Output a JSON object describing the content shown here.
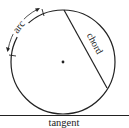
{
  "diagram": {
    "labels": {
      "arc": "arc",
      "chord": "chord",
      "tangent": "tangent"
    },
    "circle": {
      "cx": 63,
      "cy": 62,
      "r": 52
    },
    "center_point": {
      "x": 63,
      "y": 62
    },
    "chord": {
      "x1": 64,
      "y1": 10,
      "x2": 107,
      "y2": 88
    },
    "tangent_line": {
      "y": 115,
      "x1": 0,
      "x2": 129
    },
    "colors": {
      "stroke": "#222222",
      "background": "#ffffff"
    }
  }
}
